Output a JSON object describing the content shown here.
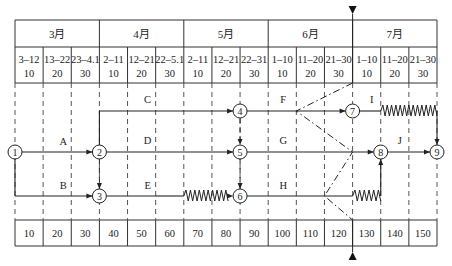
{
  "months": [
    {
      "label": "3月"
    },
    {
      "label": "4月"
    },
    {
      "label": "5月"
    },
    {
      "label": "6月"
    },
    {
      "label": "7月"
    }
  ],
  "periods": [
    {
      "range": "3–12",
      "day": "10"
    },
    {
      "range": "13–22",
      "day": "20"
    },
    {
      "range": "23–4.1",
      "day": "30"
    },
    {
      "range": "2–11",
      "day": "10"
    },
    {
      "range": "12–21",
      "day": "20"
    },
    {
      "range": "22–5.1",
      "day": "30"
    },
    {
      "range": "2–11",
      "day": "10"
    },
    {
      "range": "12–21",
      "day": "20"
    },
    {
      "range": "22–31",
      "day": "30"
    },
    {
      "range": "1–10",
      "day": "10"
    },
    {
      "range": "11–20",
      "day": "20"
    },
    {
      "range": "21–30",
      "day": "30"
    },
    {
      "range": "1–10",
      "day": "10"
    },
    {
      "range": "11–20",
      "day": "20"
    },
    {
      "range": "21–30",
      "day": "30"
    }
  ],
  "time_scale": [
    "10",
    "20",
    "30",
    "40",
    "50",
    "60",
    "70",
    "80",
    "90",
    "100",
    "110",
    "120",
    "130",
    "140",
    "150"
  ],
  "check_line_time": 120,
  "nodes": [
    {
      "id": "1",
      "time": 0,
      "row": "mid"
    },
    {
      "id": "2",
      "time": 30,
      "row": "mid"
    },
    {
      "id": "3",
      "time": 30,
      "row": "bottom"
    },
    {
      "id": "4",
      "time": 80,
      "row": "top"
    },
    {
      "id": "5",
      "time": 80,
      "row": "mid"
    },
    {
      "id": "6",
      "time": 80,
      "row": "bottom"
    },
    {
      "id": "7",
      "time": 120,
      "row": "top"
    },
    {
      "id": "8",
      "time": 130,
      "row": "mid"
    },
    {
      "id": "9",
      "time": 150,
      "row": "mid"
    }
  ],
  "activities": [
    {
      "label": "A",
      "from": "1",
      "to": "2",
      "duration": 30,
      "free_float": 0
    },
    {
      "label": "B",
      "from": "1",
      "to": "3",
      "duration": 30,
      "free_float": 0
    },
    {
      "label": "C",
      "from": "2",
      "to": "4",
      "duration": 50,
      "free_float": 0
    },
    {
      "label": "D",
      "from": "2",
      "to": "5",
      "duration": 50,
      "free_float": 0
    },
    {
      "label": "E",
      "from": "3",
      "to": "6",
      "duration": 20,
      "free_float": 30
    },
    {
      "label": "F",
      "from": "4",
      "to": "7",
      "duration": 40,
      "free_float": 0
    },
    {
      "label": "G",
      "from": "5",
      "to": "8",
      "duration": 50,
      "free_float": 0
    },
    {
      "label": "H",
      "from": "6",
      "to": "8",
      "duration": 40,
      "free_float": 10
    },
    {
      "label": "I",
      "from": "7",
      "to": "9",
      "duration": 10,
      "free_float": 20
    },
    {
      "label": "J",
      "from": "8",
      "to": "9",
      "duration": 20,
      "free_float": 0
    }
  ],
  "progress_check": {
    "F": 100,
    "G": 120,
    "H": 110
  }
}
